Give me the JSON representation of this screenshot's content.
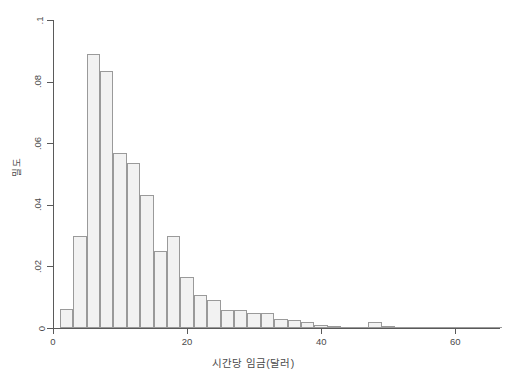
{
  "chart_data": {
    "type": "bar",
    "title": "",
    "subtitle": "",
    "xlabel": "시간당 임금(달러)",
    "ylabel": "밀도",
    "xlim": [
      0,
      67
    ],
    "ylim": [
      0,
      0.1
    ],
    "grid": false,
    "legend": null,
    "bin_width": 2,
    "x_ticks": [
      0,
      20,
      40,
      60
    ],
    "x_tick_labels": [
      "0",
      "20",
      "40",
      "60"
    ],
    "y_ticks": [
      0,
      0.02,
      0.04,
      0.06,
      0.08,
      0.1
    ],
    "y_tick_labels": [
      "0",
      ".02",
      ".04",
      ".06",
      ".08",
      ".1"
    ],
    "bin_starts": [
      1,
      3,
      5,
      7,
      9,
      11,
      13,
      15,
      17,
      19,
      21,
      23,
      25,
      27,
      29,
      31,
      33,
      35,
      37,
      39,
      41,
      43,
      45,
      47,
      49,
      51,
      53,
      55,
      57,
      59,
      61,
      63,
      65
    ],
    "categories": [
      "1-3",
      "3-5",
      "5-7",
      "7-9",
      "9-11",
      "11-13",
      "13-15",
      "15-17",
      "17-19",
      "19-21",
      "21-23",
      "23-25",
      "25-27",
      "27-29",
      "29-31",
      "31-33",
      "33-35",
      "35-37",
      "37-39",
      "39-41",
      "41-43",
      "43-45",
      "45-47",
      "47-49",
      "49-51",
      "51-53",
      "53-55",
      "55-57",
      "57-59",
      "59-61",
      "61-63",
      "63-65",
      "65-67"
    ],
    "values": [
      0.0062,
      0.03,
      0.0888,
      0.0834,
      0.0568,
      0.0536,
      0.0432,
      0.0251,
      0.03,
      0.0166,
      0.0108,
      0.009,
      0.006,
      0.0058,
      0.0048,
      0.005,
      0.003,
      0.0026,
      0.0018,
      0.0009,
      0.0006,
      0.0004,
      0.0003,
      0.0018,
      0.0008,
      0.0002,
      0.0001,
      0.0001,
      0.0,
      0.0,
      0.0001,
      0.0003,
      0.0002
    ]
  },
  "axes": {
    "y_title": "밀도",
    "x_title": "시간당 임금(달러)"
  }
}
